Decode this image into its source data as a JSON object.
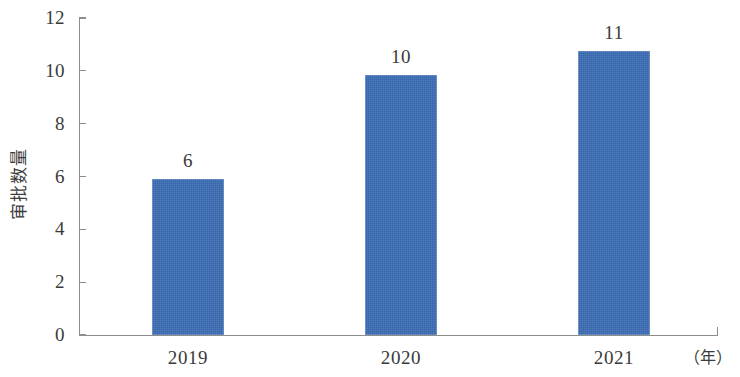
{
  "chart_data": {
    "type": "bar",
    "title": "",
    "subtitle": "",
    "xlabel": "（年）",
    "ylabel": "审批数量",
    "categories": [
      "2019",
      "2020",
      "2021"
    ],
    "values": [
      6,
      10,
      11
    ],
    "data_labels": [
      "6",
      "10",
      "11"
    ],
    "ylim": [
      0,
      12
    ],
    "y_ticks": [
      "0",
      "2",
      "4",
      "6",
      "8",
      "10",
      "12"
    ],
    "y_tick_values": [
      0,
      2,
      4,
      6,
      8,
      10,
      12
    ],
    "grid": false,
    "legend": null,
    "series": [
      {
        "name": "审批数量",
        "values": [
          6,
          10,
          11
        ],
        "color": "#3a6cb4"
      }
    ],
    "bar_color": "#3a6cb4",
    "background_color": "#ffffff",
    "axis_color": "#8d8d8d"
  },
  "axis": {
    "y_title": "审批数量",
    "x_unit": "（年）"
  },
  "y_ticks": [
    {
      "label": "12",
      "value": 12
    },
    {
      "label": "10",
      "value": 10
    },
    {
      "label": "8",
      "value": 8
    },
    {
      "label": "6",
      "value": 6
    },
    {
      "label": "4",
      "value": 4
    },
    {
      "label": "2",
      "value": 2
    },
    {
      "label": "0",
      "value": 0
    }
  ],
  "bars": [
    {
      "category": "2019",
      "value": 6,
      "label": "6"
    },
    {
      "category": "2020",
      "value": 10,
      "label": "10"
    },
    {
      "category": "2021",
      "value": 11,
      "label": "11"
    }
  ]
}
